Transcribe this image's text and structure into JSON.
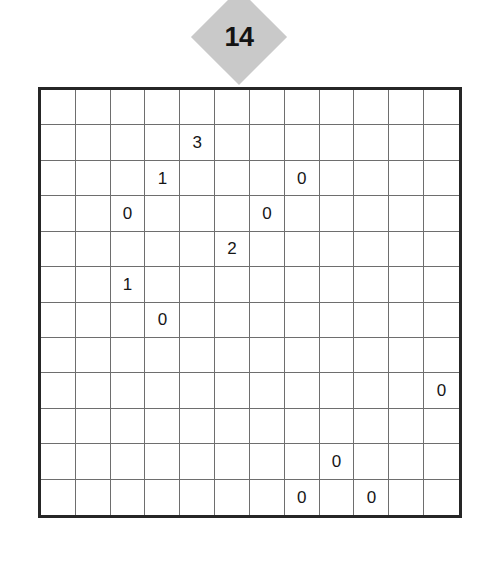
{
  "puzzle": {
    "badge_label": "14",
    "badge_shape": "diamond-icon",
    "badge_color": "#c9c9c9",
    "border_color": "#262626",
    "gridline_color": "#6e6e6e",
    "text_color": "#161616",
    "background_color": "#ffffff"
  },
  "grid": {
    "rows": 12,
    "columns": 12,
    "cells": [
      [
        "",
        "",
        "",
        "",
        "",
        "",
        "",
        "",
        "",
        "",
        "",
        ""
      ],
      [
        "",
        "",
        "",
        "",
        "3",
        "",
        "",
        "",
        "",
        "",
        "",
        ""
      ],
      [
        "",
        "",
        "",
        "1",
        "",
        "",
        "",
        "0",
        "",
        "",
        "",
        ""
      ],
      [
        "",
        "",
        "0",
        "",
        "",
        "",
        "0",
        "",
        "",
        "",
        "",
        ""
      ],
      [
        "",
        "",
        "",
        "",
        "",
        "2",
        "",
        "",
        "",
        "",
        "",
        ""
      ],
      [
        "",
        "",
        "1",
        "",
        "",
        "",
        "",
        "",
        "",
        "",
        "",
        ""
      ],
      [
        "",
        "",
        "",
        "0",
        "",
        "",
        "",
        "",
        "",
        "",
        "",
        ""
      ],
      [
        "",
        "",
        "",
        "",
        "",
        "",
        "",
        "",
        "",
        "",
        "",
        ""
      ],
      [
        "",
        "",
        "",
        "",
        "",
        "",
        "",
        "",
        "",
        "",
        "",
        "0"
      ],
      [
        "",
        "",
        "",
        "",
        "",
        "",
        "",
        "",
        "",
        "",
        "",
        ""
      ],
      [
        "",
        "",
        "",
        "",
        "",
        "",
        "",
        "",
        "0",
        "",
        "",
        ""
      ],
      [
        "",
        "",
        "",
        "",
        "",
        "",
        "",
        "0",
        "",
        "0",
        "",
        ""
      ]
    ]
  }
}
